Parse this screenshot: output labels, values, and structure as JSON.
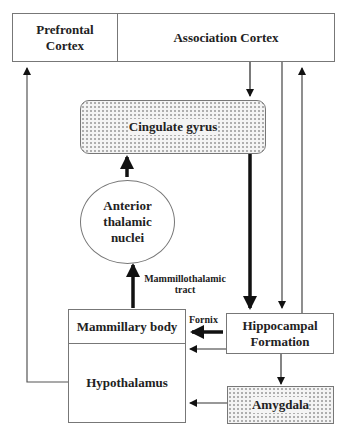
{
  "diagram": {
    "nodes": {
      "prefrontal_cortex": "Prefrontal Cortex",
      "association_cortex": "Association Cortex",
      "cingulate_gyrus": "Cingulate gyrus",
      "anterior_thalamic_nuclei": "Anterior thalamic nuclei",
      "mammillary_body": "Mammillary body",
      "hypothalamus": "Hypothalamus",
      "hippocampal_formation": "Hippocampal Formation",
      "amygdala": "Amygdala"
    },
    "edge_labels": {
      "mammillothalamic_tract": "Mammillothalamic tract",
      "fornix": "Fornix"
    },
    "edges": [
      {
        "from": "Association Cortex",
        "to": "Cingulate gyrus",
        "weight": "thin"
      },
      {
        "from": "Cingulate gyrus",
        "to": "Hippocampal Formation",
        "weight": "thick"
      },
      {
        "from": "Association Cortex",
        "to": "Hippocampal Formation",
        "weight": "thin"
      },
      {
        "from": "Hippocampal Formation",
        "to": "Association Cortex",
        "weight": "thin"
      },
      {
        "from": "Hippocampal Formation",
        "to": "Mammillary body",
        "weight": "thick",
        "label": "Fornix"
      },
      {
        "from": "Hippocampal Formation",
        "to": "Hypothalamus",
        "weight": "thin"
      },
      {
        "from": "Hippocampal Formation",
        "to": "Amygdala",
        "weight": "thin"
      },
      {
        "from": "Amygdala",
        "to": "Hypothalamus",
        "weight": "thin"
      },
      {
        "from": "Mammillary body",
        "to": "Anterior thalamic nuclei",
        "weight": "thick",
        "label": "Mammillothalamic tract"
      },
      {
        "from": "Anterior thalamic nuclei",
        "to": "Cingulate gyrus",
        "weight": "thick"
      },
      {
        "from": "Hypothalamus",
        "to": "Prefrontal Cortex",
        "weight": "thin"
      }
    ]
  }
}
